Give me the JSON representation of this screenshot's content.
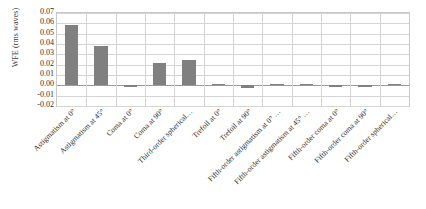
{
  "chart_data": {
    "type": "bar",
    "title": "",
    "subtitle": "",
    "xlabel": "",
    "ylabel": "WFE (rms waves)",
    "ylim": [
      -0.02,
      0.07
    ],
    "ytick_step": 0.01,
    "yticks": [
      "0.07",
      "0.06",
      "0.05",
      "0.04",
      "0.03",
      "0.02",
      "0.01",
      "0.00",
      "-0.01",
      "-0.02"
    ],
    "ytick_values": [
      0.07,
      0.06,
      0.05,
      0.04,
      0.03,
      0.02,
      0.01,
      0.0,
      -0.01,
      -0.02
    ],
    "grid": true,
    "legend": false,
    "legend_position": "none",
    "bar_color": "#808080",
    "categories": [
      "Astigmatism at 0°",
      "Astigmatism at 45°",
      "Coma at 0°",
      "Coma at 90°",
      "Third-order spherical…",
      "Trefoil at 0°",
      "Trefoil at 90°",
      "Fifth-order astigmatism at 0° …",
      "Fifth-order astigmatism at 45° …",
      "Fifth-order coma at 0°",
      "Fifth-order coma at 90°",
      "Fifth-order spherical…"
    ],
    "values": [
      0.058,
      0.038,
      -0.0008,
      0.022,
      0.025,
      0.0008,
      -0.003,
      0.0003,
      0.0003,
      -0.002,
      -0.002,
      0.0
    ]
  },
  "colors": {
    "bar": "#808080",
    "grid": "#d4d4d4",
    "axis": "#c8c8c8",
    "zero_line": "#9a9a9a",
    "text": "#2b2b2b",
    "background": "#ffffff"
  }
}
